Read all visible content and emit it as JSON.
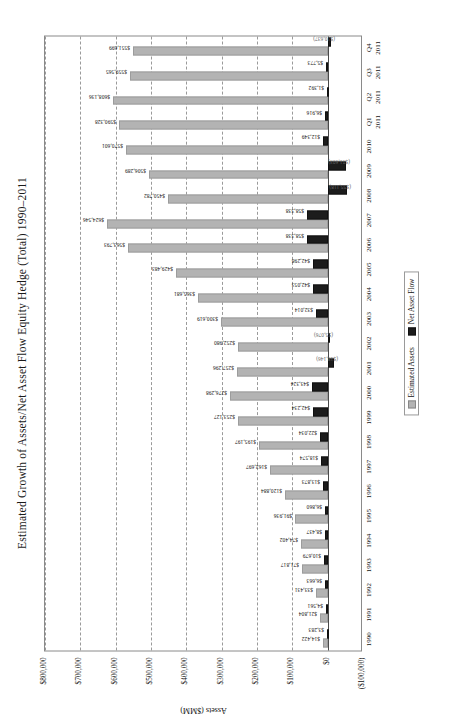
{
  "chart_data": {
    "type": "bar",
    "title": "Estimated Growth of Assets/Net Asset Flow Equity Hedge (Total) 1990–2011",
    "xlabel": "",
    "ylabel": "Assets ($MM)",
    "orientation": "vertical-bars-rendered-rotated",
    "grid": true,
    "legend_position": "bottom-center",
    "ylim": [
      -100000,
      800000
    ],
    "ytick_labels": [
      "$800,000",
      "$700,000",
      "$600,000",
      "$500,000",
      "$400,000",
      "$300,000",
      "$200,000",
      "$100,000",
      "$0",
      "($100,000)"
    ],
    "ytick_values": [
      800000,
      700000,
      600000,
      500000,
      400000,
      300000,
      200000,
      100000,
      0,
      -100000
    ],
    "categories": [
      "1990",
      "1991",
      "1992",
      "1993",
      "1994",
      "1995",
      "1996",
      "1997",
      "1998",
      "1999",
      "2000",
      "2001",
      "2002",
      "2003",
      "2004",
      "2005",
      "2006",
      "2007",
      "2008",
      "2009",
      "2010",
      "Q1 2011",
      "Q2 2011",
      "Q3 2011",
      "Q4 2011"
    ],
    "category_lines": [
      [
        "1990",
        ""
      ],
      [
        "1991",
        ""
      ],
      [
        "1992",
        ""
      ],
      [
        "1993",
        ""
      ],
      [
        "1994",
        ""
      ],
      [
        "1995",
        ""
      ],
      [
        "1996",
        ""
      ],
      [
        "1997",
        ""
      ],
      [
        "1998",
        ""
      ],
      [
        "1999",
        ""
      ],
      [
        "2000",
        ""
      ],
      [
        "2001",
        ""
      ],
      [
        "2002",
        ""
      ],
      [
        "2003",
        ""
      ],
      [
        "2004",
        ""
      ],
      [
        "2005",
        ""
      ],
      [
        "2006",
        ""
      ],
      [
        "2007",
        ""
      ],
      [
        "2008",
        ""
      ],
      [
        "2009",
        ""
      ],
      [
        "2010",
        ""
      ],
      [
        "Q1",
        "2011"
      ],
      [
        "Q2",
        "2011"
      ],
      [
        "Q3",
        "2011"
      ],
      [
        "Q4",
        "2011"
      ]
    ],
    "series": [
      {
        "name": "Estimated Assets",
        "color": "#b3b3b3",
        "values": [
          14422,
          21804,
          33431,
          71817,
          74402,
          91936,
          120884,
          162697,
          195197,
          253127,
          276298,
          257296,
          252980,
          300619,
          365681,
          429483,
          563793,
          624546,
          450782,
          506289,
          570601,
          590328,
          608136,
          559565,
          551699
        ],
        "labels": [
          "$14,422",
          "$21,804",
          "$33,431",
          "$71,817",
          "$74,402",
          "$91,936",
          "$120,884",
          "$162,697",
          "$195,197",
          "$253,127",
          "$276,298",
          "$257,296",
          "$252,980",
          "$300,619",
          "$365,681",
          "$429,483",
          "$563,793",
          "$624,546",
          "$450,782",
          "$506,289",
          "$570,601",
          "$590,328",
          "$608,136",
          "$559,565",
          "$551,699"
        ]
      },
      {
        "name": "Net Asset Flow",
        "color": "#1c1c1c",
        "values": [
          3283,
          4561,
          6663,
          10679,
          8437,
          6860,
          13873,
          18574,
          22034,
          42234,
          43324,
          -18146,
          -5076,
          32014,
          42053,
          42298,
          58338,
          58338,
          -55118,
          -51603,
          12349,
          6916,
          1392,
          5773,
          -10637
        ],
        "labels": [
          "$3,283",
          "$4,561",
          "$6,663",
          "$10,679",
          "$8,437",
          "$6,860",
          "$13,873",
          "$18,574",
          "$22,034",
          "$42,234",
          "$43,324",
          "($18,146)",
          "($5,076)",
          "$32,014",
          "$42,053",
          "$42,298",
          "$58,338",
          "$58,338",
          "($55,118)",
          "($51,603)",
          "$12,349",
          "$6,916",
          "$1,392",
          "$5,773",
          "($10,637)"
        ]
      }
    ],
    "legend_entries": [
      "Estimated Assets",
      "Net Asset Flow"
    ]
  }
}
